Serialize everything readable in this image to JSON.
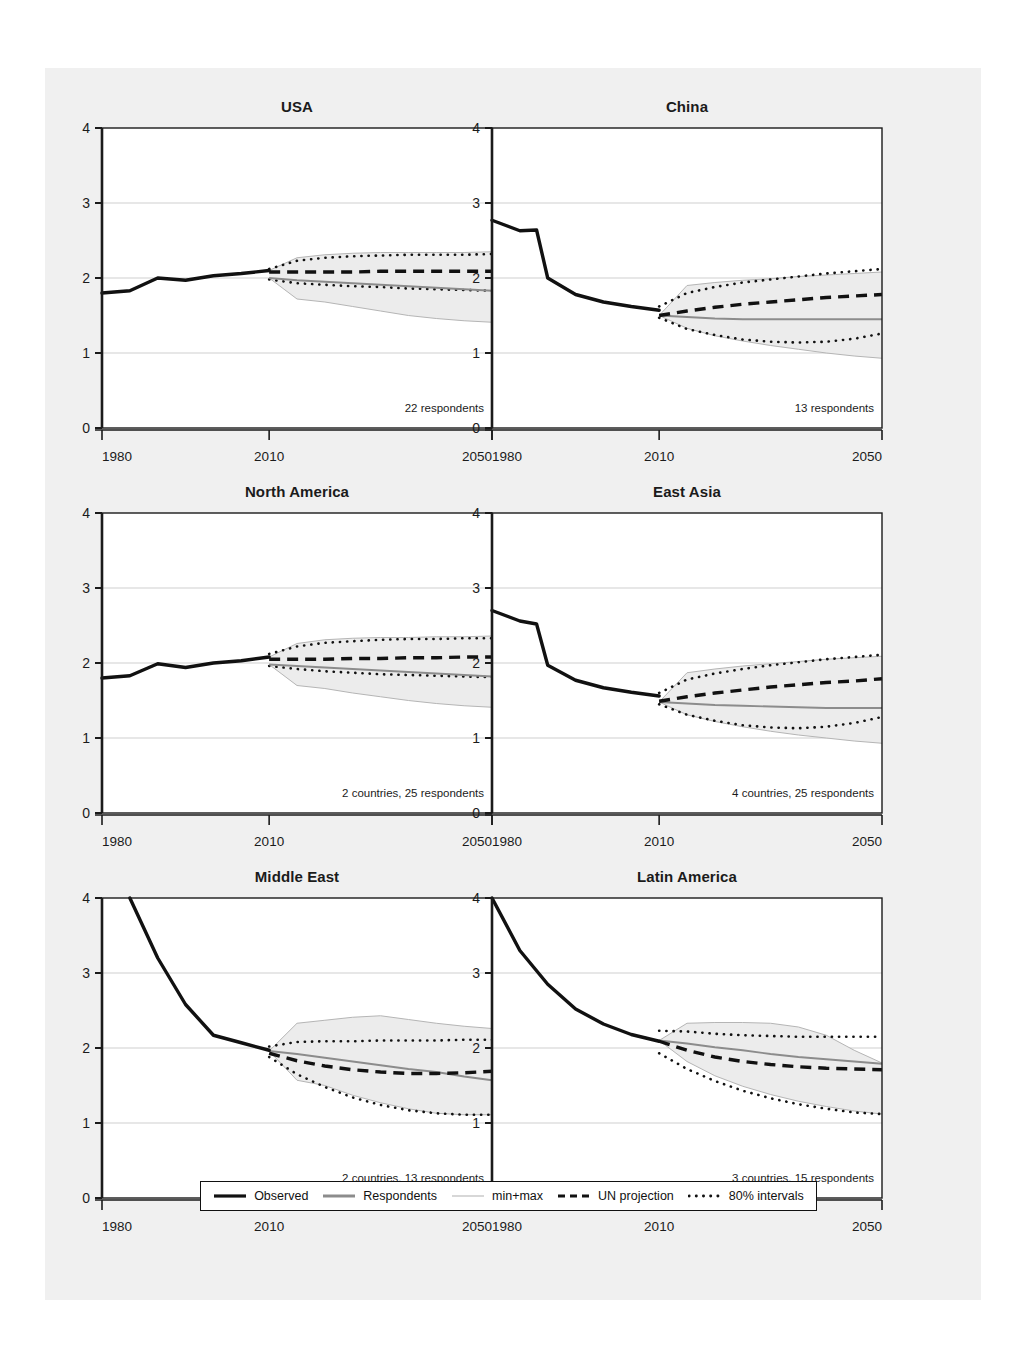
{
  "figure": {
    "background_color": "#f0f0f0",
    "panel_background": "#ffffff",
    "axis_color": "#1b1b1b",
    "grid_color": "#c9c9c9",
    "band_fill": "#ececec",
    "band_edge": "#b5b5b5",
    "respondents_color": "#8c8c8c",
    "observed_color": "#111111"
  },
  "legend": {
    "items": [
      {
        "label": "Observed",
        "style": "solid-thick-black"
      },
      {
        "label": "Respondents",
        "style": "solid-medium-gray"
      },
      {
        "label": "min+max",
        "style": "solid-thin-lightgray"
      },
      {
        "label": "UN projection",
        "style": "dashed-black"
      },
      {
        "label": "80% intervals",
        "style": "dotted-black"
      }
    ]
  },
  "axes": {
    "y_ticks": [
      "0",
      "1",
      "2",
      "3",
      "4"
    ],
    "y_gridlines": [
      1,
      2,
      3
    ],
    "x_ticks": [
      "1980",
      "2010",
      "2050"
    ],
    "xlim": [
      1980,
      2050
    ],
    "ylim": [
      0,
      4
    ]
  },
  "chart_data": {
    "type": "line",
    "title": "",
    "subtitle": "",
    "xlabel": "",
    "ylabel": "",
    "xlim": [
      1980,
      2050
    ],
    "ylim": [
      0,
      4
    ],
    "grid": true,
    "legend_position": "bottom",
    "series_names": [
      "Observed",
      "Respondents",
      "min+max",
      "UN projection",
      "80% intervals"
    ],
    "panels": [
      {
        "title": "USA",
        "note": "22 respondents",
        "observed": {
          "x": [
            1980,
            1985,
            1990,
            1995,
            2000,
            2005,
            2010
          ],
          "y": [
            1.8,
            1.83,
            2.0,
            1.97,
            2.03,
            2.06,
            2.1
          ]
        },
        "respondents": {
          "x": [
            2010,
            2015,
            2020,
            2025,
            2030,
            2035,
            2040,
            2045,
            2050
          ],
          "y": [
            2.0,
            1.97,
            1.95,
            1.93,
            1.91,
            1.89,
            1.87,
            1.85,
            1.83
          ]
        },
        "min": {
          "x": [
            2010,
            2015,
            2020,
            2025,
            2030,
            2035,
            2040,
            2045,
            2050
          ],
          "y": [
            2.0,
            1.72,
            1.68,
            1.62,
            1.56,
            1.5,
            1.46,
            1.43,
            1.41
          ]
        },
        "max": {
          "x": [
            2010,
            2015,
            2020,
            2025,
            2030,
            2035,
            2040,
            2045,
            2050
          ],
          "y": [
            2.1,
            2.27,
            2.31,
            2.33,
            2.34,
            2.34,
            2.34,
            2.34,
            2.35
          ]
        },
        "un_projection": {
          "x": [
            2010,
            2015,
            2020,
            2025,
            2030,
            2035,
            2040,
            2045,
            2050
          ],
          "y": [
            2.08,
            2.08,
            2.08,
            2.08,
            2.09,
            2.09,
            2.09,
            2.09,
            2.09
          ]
        },
        "pi80_upper": {
          "x": [
            2010,
            2015,
            2020,
            2025,
            2030,
            2035,
            2040,
            2045,
            2050
          ],
          "y": [
            2.12,
            2.23,
            2.27,
            2.29,
            2.3,
            2.31,
            2.31,
            2.31,
            2.32
          ]
        },
        "pi80_lower": {
          "x": [
            2010,
            2015,
            2020,
            2025,
            2030,
            2035,
            2040,
            2045,
            2050
          ],
          "y": [
            1.98,
            1.93,
            1.91,
            1.89,
            1.88,
            1.86,
            1.85,
            1.84,
            1.83
          ]
        }
      },
      {
        "title": "China",
        "note": "13 respondents",
        "observed": {
          "x": [
            1980,
            1985,
            1988,
            1990,
            1995,
            2000,
            2005,
            2010
          ],
          "y": [
            2.77,
            2.63,
            2.64,
            2.0,
            1.78,
            1.68,
            1.62,
            1.57
          ]
        },
        "respondents": {
          "x": [
            2010,
            2015,
            2020,
            2025,
            2030,
            2035,
            2040,
            2045,
            2050
          ],
          "y": [
            1.5,
            1.48,
            1.46,
            1.45,
            1.45,
            1.45,
            1.45,
            1.45,
            1.45
          ]
        },
        "min": {
          "x": [
            2010,
            2015,
            2020,
            2025,
            2030,
            2035,
            2040,
            2045,
            2050
          ],
          "y": [
            1.5,
            1.33,
            1.23,
            1.16,
            1.1,
            1.05,
            1.0,
            0.96,
            0.93
          ]
        },
        "max": {
          "x": [
            2010,
            2015,
            2020,
            2025,
            2030,
            2035,
            2040,
            2045,
            2050
          ],
          "y": [
            1.5,
            1.9,
            1.94,
            1.97,
            1.99,
            2.02,
            2.04,
            2.06,
            2.08
          ]
        },
        "un_projection": {
          "x": [
            2010,
            2015,
            2020,
            2025,
            2030,
            2035,
            2040,
            2045,
            2050
          ],
          "y": [
            1.5,
            1.56,
            1.61,
            1.65,
            1.68,
            1.71,
            1.74,
            1.76,
            1.78
          ]
        },
        "pi80_upper": {
          "x": [
            2010,
            2015,
            2020,
            2025,
            2030,
            2035,
            2040,
            2045,
            2050
          ],
          "y": [
            1.62,
            1.8,
            1.88,
            1.94,
            1.98,
            2.02,
            2.06,
            2.09,
            2.12
          ]
        },
        "pi80_lower": {
          "x": [
            2010,
            2015,
            2020,
            2025,
            2030,
            2035,
            2040,
            2045,
            2050
          ],
          "y": [
            1.47,
            1.32,
            1.24,
            1.18,
            1.15,
            1.14,
            1.15,
            1.19,
            1.26
          ]
        }
      },
      {
        "title": "North America",
        "note": "2 countries, 25 respondents",
        "observed": {
          "x": [
            1980,
            1985,
            1990,
            1995,
            2000,
            2005,
            2010
          ],
          "y": [
            1.8,
            1.83,
            1.99,
            1.94,
            2.0,
            2.03,
            2.08
          ]
        },
        "respondents": {
          "x": [
            2010,
            2015,
            2020,
            2025,
            2030,
            2035,
            2040,
            2045,
            2050
          ],
          "y": [
            1.98,
            1.96,
            1.94,
            1.92,
            1.9,
            1.88,
            1.86,
            1.84,
            1.82
          ]
        },
        "min": {
          "x": [
            2010,
            2015,
            2020,
            2025,
            2030,
            2035,
            2040,
            2045,
            2050
          ],
          "y": [
            1.98,
            1.7,
            1.66,
            1.6,
            1.55,
            1.5,
            1.46,
            1.43,
            1.41
          ]
        },
        "max": {
          "x": [
            2010,
            2015,
            2020,
            2025,
            2030,
            2035,
            2040,
            2045,
            2050
          ],
          "y": [
            2.08,
            2.26,
            2.31,
            2.33,
            2.34,
            2.34,
            2.35,
            2.35,
            2.36
          ]
        },
        "un_projection": {
          "x": [
            2010,
            2015,
            2020,
            2025,
            2030,
            2035,
            2040,
            2045,
            2050
          ],
          "y": [
            2.05,
            2.05,
            2.05,
            2.06,
            2.06,
            2.07,
            2.07,
            2.08,
            2.08
          ]
        },
        "pi80_upper": {
          "x": [
            2010,
            2015,
            2020,
            2025,
            2030,
            2035,
            2040,
            2045,
            2050
          ],
          "y": [
            2.12,
            2.22,
            2.27,
            2.29,
            2.31,
            2.32,
            2.32,
            2.33,
            2.33
          ]
        },
        "pi80_lower": {
          "x": [
            2010,
            2015,
            2020,
            2025,
            2030,
            2035,
            2040,
            2045,
            2050
          ],
          "y": [
            1.96,
            1.92,
            1.89,
            1.87,
            1.85,
            1.84,
            1.83,
            1.82,
            1.81
          ]
        }
      },
      {
        "title": "East Asia",
        "note": "4 countries, 25 respondents",
        "observed": {
          "x": [
            1980,
            1985,
            1988,
            1990,
            1995,
            2000,
            2005,
            2010
          ],
          "y": [
            2.7,
            2.56,
            2.52,
            1.97,
            1.77,
            1.67,
            1.61,
            1.56
          ]
        },
        "respondents": {
          "x": [
            2010,
            2015,
            2020,
            2025,
            2030,
            2035,
            2040,
            2045,
            2050
          ],
          "y": [
            1.48,
            1.46,
            1.44,
            1.43,
            1.42,
            1.41,
            1.4,
            1.4,
            1.4
          ]
        },
        "min": {
          "x": [
            2010,
            2015,
            2020,
            2025,
            2030,
            2035,
            2040,
            2045,
            2050
          ],
          "y": [
            1.48,
            1.31,
            1.22,
            1.15,
            1.09,
            1.04,
            1.0,
            0.96,
            0.93
          ]
        },
        "max": {
          "x": [
            2010,
            2015,
            2020,
            2025,
            2030,
            2035,
            2040,
            2045,
            2050
          ],
          "y": [
            1.48,
            1.87,
            1.92,
            1.96,
            1.99,
            2.02,
            2.05,
            2.07,
            2.09
          ]
        },
        "un_projection": {
          "x": [
            2010,
            2015,
            2020,
            2025,
            2030,
            2035,
            2040,
            2045,
            2050
          ],
          "y": [
            1.49,
            1.55,
            1.6,
            1.64,
            1.68,
            1.71,
            1.74,
            1.76,
            1.79
          ]
        },
        "pi80_upper": {
          "x": [
            2010,
            2015,
            2020,
            2025,
            2030,
            2035,
            2040,
            2045,
            2050
          ],
          "y": [
            1.6,
            1.78,
            1.86,
            1.92,
            1.97,
            2.01,
            2.05,
            2.08,
            2.11
          ]
        },
        "pi80_lower": {
          "x": [
            2010,
            2015,
            2020,
            2025,
            2030,
            2035,
            2040,
            2045,
            2050
          ],
          "y": [
            1.45,
            1.31,
            1.23,
            1.17,
            1.14,
            1.13,
            1.15,
            1.2,
            1.28
          ]
        }
      },
      {
        "title": "Middle East",
        "note": "2 countries, 13 respondents",
        "observed": {
          "x": [
            1985,
            1990,
            1995,
            2000,
            2005,
            2010
          ],
          "y": [
            4.0,
            3.2,
            2.58,
            2.17,
            2.07,
            1.97
          ]
        },
        "respondents": {
          "x": [
            2010,
            2015,
            2020,
            2025,
            2030,
            2035,
            2040,
            2045,
            2050
          ],
          "y": [
            1.96,
            1.92,
            1.87,
            1.82,
            1.77,
            1.72,
            1.68,
            1.62,
            1.57
          ]
        },
        "min": {
          "x": [
            2010,
            2015,
            2020,
            2025,
            2030,
            2035,
            2040,
            2045,
            2050
          ],
          "y": [
            1.96,
            1.57,
            1.5,
            1.37,
            1.27,
            1.19,
            1.13,
            1.11,
            1.11
          ]
        },
        "max": {
          "x": [
            2010,
            2015,
            2020,
            2025,
            2030,
            2035,
            2040,
            2045,
            2050
          ],
          "y": [
            1.96,
            2.33,
            2.37,
            2.41,
            2.43,
            2.38,
            2.33,
            2.29,
            2.26
          ]
        },
        "un_projection": {
          "x": [
            2010,
            2015,
            2020,
            2025,
            2030,
            2035,
            2040,
            2045,
            2050
          ],
          "y": [
            1.93,
            1.83,
            1.76,
            1.71,
            1.68,
            1.66,
            1.66,
            1.67,
            1.69
          ]
        },
        "pi80_upper": {
          "x": [
            2010,
            2015,
            2020,
            2025,
            2030,
            2035,
            2040,
            2045,
            2050
          ],
          "y": [
            2.02,
            2.08,
            2.09,
            2.09,
            2.1,
            2.1,
            2.1,
            2.11,
            2.11
          ]
        },
        "pi80_lower": {
          "x": [
            2010,
            2015,
            2020,
            2025,
            2030,
            2035,
            2040,
            2045,
            2050
          ],
          "y": [
            1.88,
            1.65,
            1.48,
            1.34,
            1.24,
            1.17,
            1.13,
            1.11,
            1.11
          ]
        }
      },
      {
        "title": "Latin America",
        "note": "3 countries, 15 respondents",
        "observed": {
          "x": [
            1980,
            1985,
            1990,
            1995,
            2000,
            2005,
            2010
          ],
          "y": [
            4.0,
            3.3,
            2.85,
            2.52,
            2.32,
            2.18,
            2.09
          ]
        },
        "respondents": {
          "x": [
            2010,
            2015,
            2020,
            2025,
            2030,
            2035,
            2040,
            2045,
            2050
          ],
          "y": [
            2.1,
            2.06,
            2.01,
            1.97,
            1.92,
            1.88,
            1.85,
            1.82,
            1.79
          ]
        },
        "min": {
          "x": [
            2010,
            2015,
            2020,
            2025,
            2030,
            2035,
            2040,
            2045,
            2050
          ],
          "y": [
            2.1,
            1.82,
            1.63,
            1.49,
            1.38,
            1.29,
            1.22,
            1.16,
            1.12
          ]
        },
        "max": {
          "x": [
            2010,
            2015,
            2020,
            2025,
            2030,
            2035,
            2040,
            2045,
            2050
          ],
          "y": [
            2.1,
            2.33,
            2.34,
            2.34,
            2.33,
            2.28,
            2.17,
            1.97,
            1.8
          ]
        },
        "un_projection": {
          "x": [
            2010,
            2015,
            2020,
            2025,
            2030,
            2035,
            2040,
            2045,
            2050
          ],
          "y": [
            2.09,
            1.97,
            1.88,
            1.82,
            1.78,
            1.75,
            1.73,
            1.72,
            1.71
          ]
        },
        "pi80_upper": {
          "x": [
            2010,
            2015,
            2020,
            2025,
            2030,
            2035,
            2040,
            2045,
            2050
          ],
          "y": [
            2.23,
            2.22,
            2.19,
            2.17,
            2.16,
            2.15,
            2.15,
            2.15,
            2.15
          ]
        },
        "pi80_lower": {
          "x": [
            2010,
            2015,
            2020,
            2025,
            2030,
            2035,
            2040,
            2045,
            2050
          ],
          "y": [
            1.93,
            1.72,
            1.56,
            1.43,
            1.33,
            1.25,
            1.19,
            1.14,
            1.12
          ]
        }
      }
    ]
  }
}
